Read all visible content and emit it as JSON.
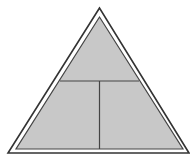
{
  "diagram": {
    "type": "segmented-triangle",
    "colors": {
      "background": "#ffffff",
      "fill": "#c8c8c8",
      "stroke": "#333333",
      "gap": "#ffffff"
    },
    "outer_triangle": {
      "points": "99.5,8 8,153 189,153"
    },
    "inner_triangle": {
      "points": "99.5,17 16,149 183,149"
    },
    "horizontal_divider": {
      "x1": 60,
      "y1": 81,
      "x2": 139,
      "y2": 81
    },
    "vertical_divider": {
      "x1": 99.5,
      "y1": 81,
      "x2": 99.5,
      "y2": 149
    },
    "sections": [
      {
        "name": "top-section",
        "label": ""
      },
      {
        "name": "bottom-left-section",
        "label": ""
      },
      {
        "name": "bottom-right-section",
        "label": ""
      }
    ]
  }
}
